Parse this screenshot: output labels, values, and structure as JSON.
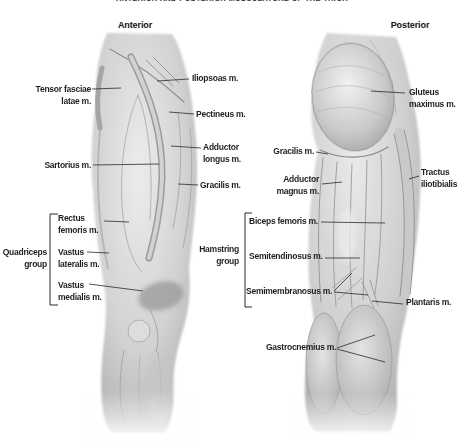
{
  "title": "ANTERIOR AND POSTERIOR MUSCULATURE OF THE THIGH",
  "colors": {
    "background": "#ffffff",
    "label_text": "#1f1f1f",
    "leader_line": "#2b2b2b",
    "illustration_base": "#d4d4d4",
    "illustration_shadow": "#9a9a9a",
    "illustration_highlight": "#efefef"
  },
  "anterior": {
    "heading": "Anterior",
    "labels": {
      "tensor_fasciae_latae": "Tensor fasciae\nlatae m.",
      "iliopsoas": "Iliopsoas m.",
      "pectineus": "Pectineus m.",
      "sartorius": "Sartorius m.",
      "adductor_longus": "Adductor\nlongus m.",
      "gracilis": "Gracilis m.",
      "quadriceps_group": "Quadriceps\ngroup",
      "rectus_femoris": "Rectus\nfemoris m.",
      "vastus_lateralis": "Vastus\nlateralis m.",
      "vastus_medialis": "Vastus\nmedialis m."
    }
  },
  "posterior": {
    "heading": "Posterior",
    "labels": {
      "gluteus_maximus": "Gluteus\nmaximus m.",
      "gracilis": "Gracilis m.",
      "adductor_magnus": "Adductor\nmagnus m.",
      "tractus_iliotibialis": "Tractus\niliotibialis",
      "hamstring_group": "Hamstring\ngroup",
      "biceps_femoris": "Biceps femoris m.",
      "semitendinosus": "Semitendinosus m.",
      "semimembranosus": "Semimembranosus m.",
      "plantaris": "Plantaris m.",
      "gastrocnemius": "Gastrocnemius m."
    }
  }
}
